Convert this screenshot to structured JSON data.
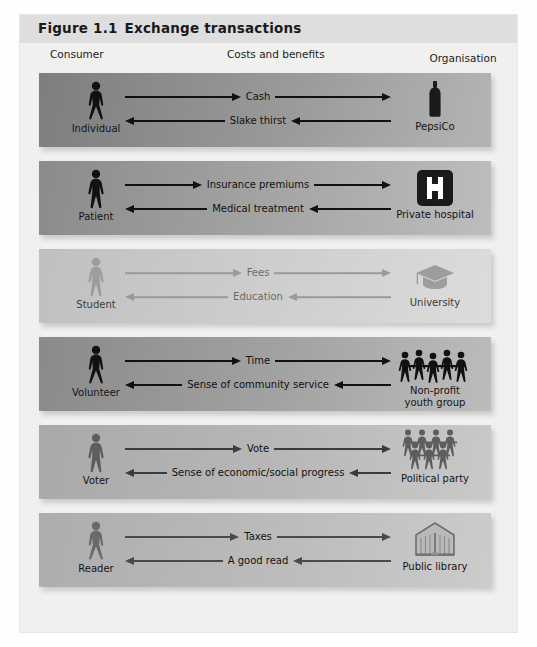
{
  "figure": {
    "number": "Figure 1.1",
    "title": "Exchange transactions"
  },
  "headers": {
    "consumer": "Consumer",
    "costs": "Costs and benefits",
    "organisation": "Organisation"
  },
  "rows": [
    {
      "consumer_label": "Individual",
      "consumer_icon": "female-person-icon",
      "org_label": "PepsiCo",
      "org_icon": "bottle-icon",
      "outbound": "Cash",
      "inbound": "Slake thirst",
      "tone": "dark"
    },
    {
      "consumer_label": "Patient",
      "consumer_icon": "male-person-icon",
      "org_label": "Private hospital",
      "org_icon": "hospital-h-icon",
      "outbound": "Insurance premiums",
      "inbound": "Medical treatment",
      "tone": "dark"
    },
    {
      "consumer_label": "Student",
      "consumer_icon": "male-person-icon",
      "org_label": "University",
      "org_icon": "graduation-cap-icon",
      "outbound": "Fees",
      "inbound": "Education",
      "tone": "light"
    },
    {
      "consumer_label": "Volunteer",
      "consumer_icon": "female-person-icon",
      "org_label": "Non-profit\nyouth group",
      "org_label_line1": "Non-profit",
      "org_label_line2": "youth group",
      "org_icon": "people-group-icon",
      "outbound": "Time",
      "inbound": "Sense of community service",
      "tone": "dark"
    },
    {
      "consumer_label": "Voter",
      "consumer_icon": "male-person-icon",
      "org_label": "Political party",
      "org_icon": "people-crowd-icon",
      "outbound": "Vote",
      "inbound": "Sense of economic/social progress",
      "tone": "medium"
    },
    {
      "consumer_label": "Reader",
      "consumer_icon": "female-person-icon",
      "org_label": "Public library",
      "org_icon": "library-building-icon",
      "outbound": "Taxes",
      "inbound": "A good read",
      "tone": "medium"
    }
  ],
  "colors": {
    "title_bar": "#dedede",
    "figure_bg": "#f0f0ef",
    "band_dark": "#8f8f8f",
    "band_light": "#cfcfcf",
    "arrow_dark": "#111111",
    "arrow_light": "#9a9a9a"
  }
}
